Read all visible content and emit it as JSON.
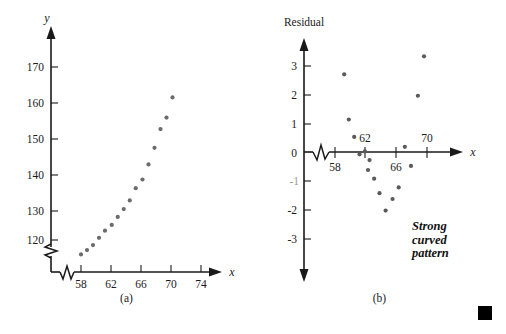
{
  "figure": {
    "panels": [
      {
        "id": "a",
        "caption": "(a)",
        "x_axis_label": "x",
        "y_axis_label": "y"
      },
      {
        "id": "b",
        "caption": "(b)",
        "x_axis_label": "x",
        "y_axis_label": "Residual",
        "annotation": "Strong\ncurved\npattern"
      }
    ],
    "end_marker": "■"
  },
  "chart_data": [
    {
      "type": "scatter",
      "title": "(a)",
      "xlabel": "x",
      "ylabel": "y",
      "xlim": [
        56.5,
        76.5
      ],
      "ylim": [
        113,
        175
      ],
      "xticks": [
        58,
        62,
        66,
        70,
        74
      ],
      "yticks": [
        120,
        130,
        140,
        150,
        160,
        170
      ],
      "axis_break_x": true,
      "axis_break_y": true,
      "grid": false,
      "legend": null,
      "x": [
        58.0,
        58.8,
        59.6,
        60.4,
        61.2,
        62.1,
        62.9,
        63.7,
        64.5,
        65.3,
        66.2,
        67.0,
        67.8,
        68.6,
        69.4,
        70.2,
        71.0
      ],
      "y": [
        116.0,
        117.2,
        118.6,
        120.6,
        122.6,
        124.2,
        126.4,
        128.6,
        131.0,
        134.4,
        136.8,
        141.0,
        145.6,
        150.8,
        154.0,
        159.6
      ]
    },
    {
      "type": "scatter",
      "title": "(b)",
      "xlabel": "x",
      "ylabel": "Residual",
      "xlim": [
        56.5,
        76.5
      ],
      "ylim": [
        -3.6,
        3.6
      ],
      "xticks": [
        58,
        62,
        66,
        70
      ],
      "yticks": [
        3,
        2,
        1,
        0,
        -1,
        -2,
        -3
      ],
      "axis_break_x": true,
      "grid": false,
      "legend": null,
      "reference_line_y": 0,
      "annotation": "Strong curved pattern",
      "x": [
        59.2,
        59.8,
        60.5,
        61.2,
        61.9,
        62.5,
        62.3,
        63.1,
        63.8,
        64.6,
        65.5,
        66.3,
        67.1,
        67.9,
        68.8,
        69.6,
        70.2,
        71.4
      ],
      "y": [
        2.68,
        1.12,
        0.52,
        -0.08,
        0.02,
        -0.28,
        -0.62,
        -0.92,
        -1.42,
        -2.02,
        -1.62,
        -1.22,
        0.18,
        -0.48,
        1.94,
        3.3
      ]
    }
  ]
}
